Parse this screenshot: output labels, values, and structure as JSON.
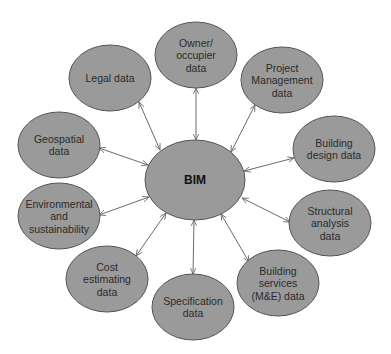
{
  "diagram": {
    "type": "hub-and-spoke",
    "colors": {
      "node_fill": "#9a9a9a",
      "node_stroke": "#555555",
      "connector": "#6a6a6a",
      "text": "#2a2a2a"
    },
    "center": {
      "label": "BIM",
      "cx": 195,
      "cy": 180,
      "rx": 50,
      "ry": 40
    },
    "nodes": [
      {
        "id": "owner-occupier",
        "lines": [
          "Owner/",
          "occupier",
          "data"
        ],
        "cx": 196,
        "cy": 55,
        "rx": 41,
        "ry": 33
      },
      {
        "id": "project-management",
        "lines": [
          "Project",
          "Management",
          "data"
        ],
        "cx": 282,
        "cy": 80,
        "rx": 41,
        "ry": 33
      },
      {
        "id": "building-design",
        "lines": [
          "Building",
          "design data"
        ],
        "cx": 334,
        "cy": 149,
        "rx": 41,
        "ry": 33
      },
      {
        "id": "structural-analysis",
        "lines": [
          "Structural",
          "analysis",
          "data"
        ],
        "cx": 330,
        "cy": 223,
        "rx": 41,
        "ry": 33
      },
      {
        "id": "building-services",
        "lines": [
          "Building",
          "services",
          "(M&E) data"
        ],
        "cx": 278,
        "cy": 283,
        "rx": 41,
        "ry": 33
      },
      {
        "id": "specification",
        "lines": [
          "Specification",
          "data"
        ],
        "cx": 193,
        "cy": 307,
        "rx": 41,
        "ry": 33
      },
      {
        "id": "cost-estimating",
        "lines": [
          "Cost",
          "estimating",
          "data"
        ],
        "cx": 107,
        "cy": 279,
        "rx": 41,
        "ry": 33
      },
      {
        "id": "environmental",
        "lines": [
          "Environmental",
          "and",
          "sustainability"
        ],
        "cx": 59,
        "cy": 216,
        "rx": 41,
        "ry": 33
      },
      {
        "id": "geospatial",
        "lines": [
          "Geospatial",
          "data"
        ],
        "cx": 59,
        "cy": 145,
        "rx": 41,
        "ry": 33
      },
      {
        "id": "legal",
        "lines": [
          "Legal data"
        ],
        "cx": 110,
        "cy": 78,
        "rx": 41,
        "ry": 33
      }
    ],
    "connectors": [
      {
        "to": "owner-occupier",
        "x1": 196,
        "y1": 140,
        "x2": 196,
        "y2": 88
      },
      {
        "to": "project-management",
        "x1": 231,
        "y1": 152,
        "x2": 255,
        "y2": 105
      },
      {
        "to": "building-design",
        "x1": 244,
        "y1": 171,
        "x2": 294,
        "y2": 158
      },
      {
        "to": "structural-analysis",
        "x1": 242,
        "y1": 198,
        "x2": 290,
        "y2": 222
      },
      {
        "to": "building-services",
        "x1": 221,
        "y1": 214,
        "x2": 249,
        "y2": 262
      },
      {
        "to": "specification",
        "x1": 194,
        "y1": 220,
        "x2": 193,
        "y2": 274
      },
      {
        "to": "cost-estimating",
        "x1": 166,
        "y1": 213,
        "x2": 136,
        "y2": 256
      },
      {
        "to": "environmental",
        "x1": 149,
        "y1": 197,
        "x2": 99,
        "y2": 215
      },
      {
        "to": "geospatial",
        "x1": 148,
        "y1": 165,
        "x2": 99,
        "y2": 148
      },
      {
        "to": "legal",
        "x1": 160,
        "y1": 150,
        "x2": 139,
        "y2": 102
      }
    ]
  }
}
